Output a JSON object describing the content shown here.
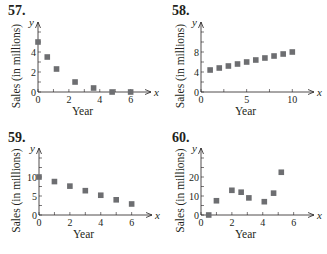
{
  "figure": {
    "background": "#ffffff",
    "marker_color": "#6d6e71",
    "axis_color": "#231f20"
  },
  "chart_data": [
    {
      "id": "57",
      "label": "57.",
      "type": "scatter",
      "xlabel": "Year",
      "ylabel": "Sales (in millions)",
      "x_axis_letter": "x",
      "y_axis_letter": "y",
      "xlim": [
        0,
        6.8
      ],
      "ylim": [
        0,
        6
      ],
      "xticks": [
        0,
        2,
        4,
        6
      ],
      "yticks": [
        0,
        2,
        4
      ],
      "x": [
        0,
        0.6,
        1.2,
        2.4,
        3.6,
        4.8,
        6
      ],
      "y": [
        5,
        3.5,
        2.3,
        1.0,
        0.4,
        0,
        0
      ]
    },
    {
      "id": "58",
      "label": "58.",
      "type": "scatter",
      "xlabel": "Year",
      "ylabel": "Sales (in millions)",
      "x_axis_letter": "x",
      "y_axis_letter": "y",
      "xlim": [
        0,
        11.5
      ],
      "ylim": [
        0,
        12
      ],
      "xticks": [
        0,
        5,
        10
      ],
      "yticks": [
        0,
        4,
        8
      ],
      "x": [
        1,
        2,
        3,
        4,
        5,
        6,
        7,
        8,
        9,
        10
      ],
      "y": [
        4.4,
        4.8,
        5.2,
        5.6,
        6.0,
        6.4,
        6.8,
        7.2,
        7.6,
        8.0
      ]
    },
    {
      "id": "59",
      "label": "59.",
      "type": "scatter",
      "xlabel": "Year",
      "ylabel": "Sales (in millions)",
      "x_axis_letter": "x",
      "y_axis_letter": "y",
      "xlim": [
        0,
        6.8
      ],
      "ylim": [
        0,
        15
      ],
      "xticks": [
        0,
        2,
        4,
        6
      ],
      "yticks": [
        0,
        5,
        10
      ],
      "x": [
        0,
        1,
        2,
        3,
        4,
        5,
        6
      ],
      "y": [
        10,
        8.8,
        7.6,
        6.4,
        5.2,
        4.0,
        2.9
      ]
    },
    {
      "id": "60",
      "label": "60.",
      "type": "scatter",
      "xlabel": "Year",
      "ylabel": "Sales (in millions)",
      "x_axis_letter": "x",
      "y_axis_letter": "y",
      "xlim": [
        0,
        6.8
      ],
      "ylim": [
        0,
        30
      ],
      "xticks": [
        0,
        2,
        4,
        6
      ],
      "yticks": [
        0,
        10,
        20
      ],
      "x": [
        0.5,
        1,
        2,
        2.6,
        3.1,
        4.1,
        4.7,
        5.2
      ],
      "y": [
        0,
        7.5,
        13,
        12,
        9,
        7,
        11.5,
        22.5
      ]
    }
  ]
}
